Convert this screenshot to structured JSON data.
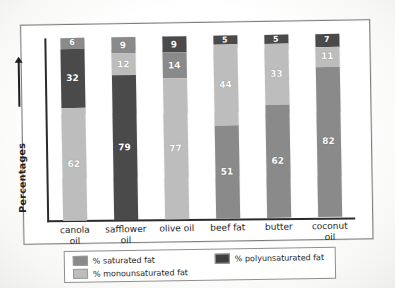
{
  "chart_data": {
    "type": "bar",
    "subtype": "stacked-bar",
    "title": "",
    "xlabel": "",
    "ylabel": "Percentages",
    "ylim": [
      0,
      100
    ],
    "grid": false,
    "legend_position": "bottom",
    "categories": [
      "canola oil",
      "safflower oil",
      "olive oil",
      "beef fat",
      "butter",
      "coconut oil"
    ],
    "series": [
      {
        "name": "% saturated fat",
        "key": "sat",
        "color": "#8a8a8a",
        "values": [
          6,
          9,
          9,
          51,
          62,
          82
        ]
      },
      {
        "name": "% monounsaturated fat",
        "key": "mono",
        "color": "#bdbdbd",
        "values": [
          62,
          12,
          77,
          44,
          33,
          11
        ]
      },
      {
        "name": "% polyunsaturated fat",
        "key": "poly",
        "color": "#4a4a4a",
        "values": [
          32,
          79,
          14,
          5,
          5,
          7
        ]
      }
    ],
    "bars": [
      {
        "category_line1": "canola",
        "category_line2": "oil",
        "segments": [
          {
            "key": "sat",
            "value": 6,
            "label": "6"
          },
          {
            "key": "poly",
            "value": 32,
            "label": "32"
          },
          {
            "key": "mono",
            "value": 62,
            "label": "62"
          }
        ]
      },
      {
        "category_line1": "safflower",
        "category_line2": "oil",
        "segments": [
          {
            "key": "sat",
            "value": 9,
            "label": "9"
          },
          {
            "key": "mono",
            "value": 12,
            "label": "12"
          },
          {
            "key": "poly",
            "value": 79,
            "label": "79"
          }
        ]
      },
      {
        "category_line1": "olive oil",
        "category_line2": "",
        "segments": [
          {
            "key": "poly",
            "value": 9,
            "label": "9"
          },
          {
            "key": "sat",
            "value": 14,
            "label": "14"
          },
          {
            "key": "mono",
            "value": 77,
            "label": "77"
          }
        ]
      },
      {
        "category_line1": "beef fat",
        "category_line2": "",
        "segments": [
          {
            "key": "poly",
            "value": 5,
            "label": "5"
          },
          {
            "key": "mono",
            "value": 44,
            "label": "44"
          },
          {
            "key": "sat",
            "value": 51,
            "label": "51"
          }
        ]
      },
      {
        "category_line1": "butter",
        "category_line2": "",
        "segments": [
          {
            "key": "poly",
            "value": 5,
            "label": "5"
          },
          {
            "key": "mono",
            "value": 33,
            "label": "33"
          },
          {
            "key": "sat",
            "value": 62,
            "label": "62"
          }
        ]
      },
      {
        "category_line1": "coconut",
        "category_line2": "oil",
        "segments": [
          {
            "key": "poly",
            "value": 7,
            "label": "7"
          },
          {
            "key": "mono",
            "value": 11,
            "label": "11"
          },
          {
            "key": "sat",
            "value": 82,
            "label": "82"
          }
        ]
      }
    ]
  },
  "axis": {
    "y_label": "Percentages"
  },
  "legend": {
    "left_items": [
      {
        "key": "sat",
        "label": "% saturated fat"
      },
      {
        "key": "mono",
        "label": "% monounsaturated fat"
      }
    ],
    "right_items": [
      {
        "key": "poly",
        "label": "% polyunsaturated fat"
      }
    ]
  }
}
